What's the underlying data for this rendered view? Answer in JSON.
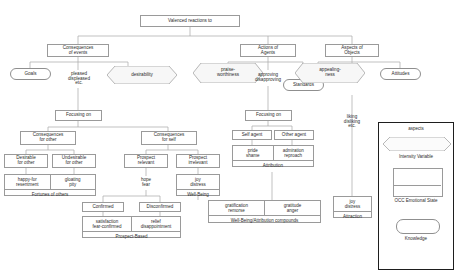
{
  "diagram": {
    "root": {
      "label": "Valenced reactions to"
    },
    "branches": {
      "consequences_of_events": "Consequences\nof events",
      "actions_of_agents": "Actions of\nAgents",
      "aspects_of_objects": "Aspects of\nObjects"
    },
    "knowledge_nodes": {
      "goals": "Goals",
      "standards": "Standards",
      "attitudes": "Attitudes"
    },
    "intensity_variables": {
      "desirability": "desirability",
      "praiseworthiness": "praise-\nworthiness",
      "appealingness": "appealing-\nness"
    },
    "reaction_labels": {
      "pleased_displeased": "pleased\ndispleased\netc.",
      "approving_disapproving": "approving\ndisapproving",
      "liking_disliking": "liking\ndisliking\netc."
    },
    "focusing_on_left": "Focusing on",
    "focusing_on_mid": "Focusing on",
    "consequences_for_other": "Consequences\nfor other",
    "consequences_for_self": "Consequences\nfor self",
    "self_agent": "Self agent",
    "other_agent": "Other agent",
    "desirable_for_other": "Desirable\nfor other",
    "undesirable_for_other": "Undesirable\nfor other",
    "prospect_relevant": "Prospect\nrelevant",
    "prospect_irrelevant": "Prospect\nirrelevant",
    "confirmed": "Confirmed",
    "disconfirmed": "Disconfirmed",
    "compounds": {
      "fortunes_of_others": {
        "left": "happy-for\nresentment",
        "right": "gloating\npity",
        "group": "Fortunes of others"
      },
      "prospect_based": {
        "left": "satisfaction\nfear-confirmed",
        "right": "relief\ndisappointment",
        "group": "Prospect-Based"
      },
      "attribution": {
        "left": "pride\nshame",
        "right": "admiration\nreproach",
        "group": "Attribution"
      },
      "wellbeing_attribution": {
        "left": "gratification\nremorse",
        "right": "gratitude\nanger",
        "group": "Well-Being/Attribution compounds"
      },
      "wellbeing": {
        "left": "joy\ndistress",
        "group": "Well-Being"
      },
      "attraction": {
        "left": "joy\ndistress",
        "group": "Attraction"
      },
      "hope_fear": {
        "left": "hope\nfear"
      }
    },
    "legend": {
      "intensity_variable_label": "Intensity Variable",
      "intensity_variable_title": "aspects",
      "occ_state_label": "OCC Emotional State",
      "knowledge_label": "Knowledge"
    },
    "colors": {
      "stroke": "#9a9a9a",
      "text": "#2b2b2b",
      "legend_border": "#1e1e1e",
      "background": "#ffffff"
    }
  }
}
